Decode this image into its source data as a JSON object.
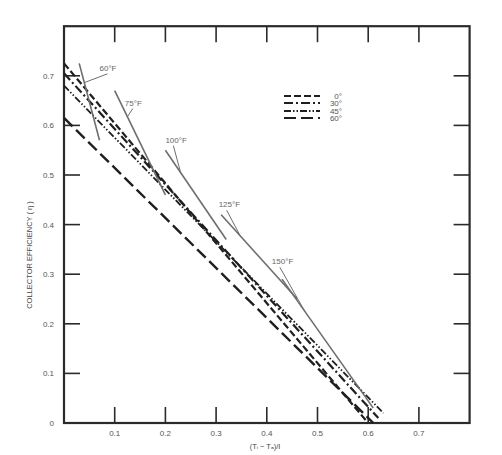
{
  "chart_data": {
    "type": "line",
    "title": "",
    "xlabel": "(Ti − Ta)/I",
    "ylabel": "COLLECTOR EFFICIENCY ( η )",
    "xlim": [
      0,
      0.8
    ],
    "ylim": [
      0,
      0.8
    ],
    "x_ticks": [
      0.1,
      0.2,
      0.3,
      0.4,
      0.5,
      0.6,
      0.7
    ],
    "x_tick_labels": [
      "0.1",
      "0.2",
      "0.3",
      "0.4",
      "0.5",
      "0.6",
      "0.7"
    ],
    "y_ticks": [
      0,
      0.1,
      0.2,
      0.3,
      0.4,
      0.5,
      0.6,
      0.7
    ],
    "y_tick_labels": [
      "0",
      "0.1",
      "0.2",
      "0.3",
      "0.4",
      "0.5",
      "0.6",
      "0.7"
    ],
    "grid": false,
    "legend_position": "upper-center",
    "series": [
      {
        "name": "0°",
        "style": "short-dash",
        "x": [
          0,
          0.6
        ],
        "y": [
          0.725,
          0.0
        ]
      },
      {
        "name": "30°",
        "style": "dash-dot",
        "x": [
          0,
          0.62
        ],
        "y": [
          0.705,
          0.01
        ]
      },
      {
        "name": "45°",
        "style": "dash-dot-dot",
        "x": [
          0,
          0.63
        ],
        "y": [
          0.68,
          0.02
        ]
      },
      {
        "name": "60°",
        "style": "long-dash",
        "x": [
          0,
          0.61
        ],
        "y": [
          0.615,
          0.0
        ]
      }
    ],
    "isotherms": [
      {
        "name": "60°F",
        "x": [
          0.03,
          0.07
        ],
        "y": [
          0.725,
          0.57
        ]
      },
      {
        "name": "75°F",
        "x": [
          0.1,
          0.2
        ],
        "y": [
          0.67,
          0.46
        ]
      },
      {
        "name": "100°F",
        "x": [
          0.2,
          0.32
        ],
        "y": [
          0.55,
          0.37
        ]
      },
      {
        "name": "125°F",
        "x": [
          0.31,
          0.46
        ],
        "y": [
          0.42,
          0.25
        ]
      },
      {
        "name": "150°F",
        "x": [
          0.43,
          0.61
        ],
        "y": [
          0.29,
          0.03
        ]
      }
    ],
    "annotations": [
      {
        "text": "60°F",
        "x": 0.07,
        "y": 0.71
      },
      {
        "text": "75°F",
        "x": 0.12,
        "y": 0.64
      },
      {
        "text": "100°F",
        "x": 0.2,
        "y": 0.565
      },
      {
        "text": "125°F",
        "x": 0.305,
        "y": 0.435
      },
      {
        "text": "150°F",
        "x": 0.41,
        "y": 0.32
      }
    ]
  },
  "legend": {
    "items": [
      {
        "label": "0°"
      },
      {
        "label": "30°"
      },
      {
        "label": "45°"
      },
      {
        "label": "60°"
      }
    ]
  },
  "axes": {
    "xlabel": "(Tᵢ − Tₐ)/I",
    "ylabel": "COLLECTOR EFFICIENCY ( η )"
  }
}
